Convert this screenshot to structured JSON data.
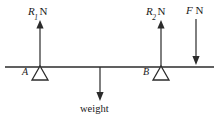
{
  "figure": {
    "type": "free-body-diagram",
    "stroke_color": "#2b2b2b",
    "background_color": "#ffffff"
  },
  "labels": {
    "reaction_left": {
      "symbol": "R",
      "subscript": "1",
      "unit": "N"
    },
    "reaction_right": {
      "symbol": "R",
      "subscript": "2",
      "unit": "N"
    },
    "applied_force": {
      "symbol": "F",
      "unit": "N"
    },
    "support_left": "A",
    "support_right": "B",
    "weight": "weight"
  },
  "geometry": {
    "beam": {
      "x1": 5,
      "x2": 214,
      "y": 67
    },
    "support_a": {
      "apex_x": 40,
      "base_y": 80
    },
    "support_b": {
      "apex_x": 161,
      "base_y": 80
    },
    "arrow_r1": {
      "x": 40,
      "from_y": 67,
      "to_y": 22,
      "direction": "up"
    },
    "arrow_r2": {
      "x": 161,
      "from_y": 67,
      "to_y": 22,
      "direction": "up"
    },
    "arrow_f": {
      "x": 196,
      "from_y": 20,
      "to_y": 64,
      "direction": "down"
    },
    "arrow_weight": {
      "x": 100,
      "from_y": 67,
      "to_y": 101,
      "direction": "down"
    }
  }
}
